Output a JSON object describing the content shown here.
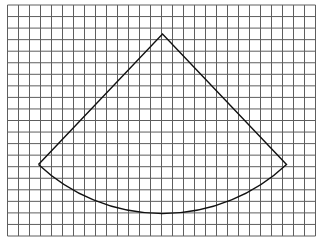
{
  "diagram": {
    "type": "sector-on-grid",
    "grid": {
      "columns": 28,
      "rows": 20,
      "origin_x": 7.5,
      "origin_y": 5,
      "cell_width": 11,
      "cell_height": 11.55,
      "line_color": "#5e5e5e"
    },
    "sector": {
      "apex": [
        162.5,
        34
      ],
      "left_point": [
        38.5,
        164.5
      ],
      "right_point": [
        286.5,
        164.5
      ],
      "arc_bottom": [
        162.5,
        218.5
      ],
      "radius": 181,
      "line_color": "#111111"
    }
  }
}
